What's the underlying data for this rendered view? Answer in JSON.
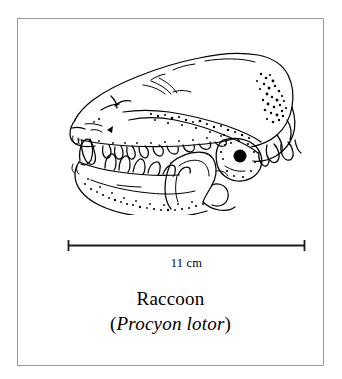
{
  "figure": {
    "type": "scientific-illustration-plate",
    "frame_color": "#9a9a9a",
    "background_color": "#ffffff",
    "ink_color": "#000000"
  },
  "illustration": {
    "name": "raccoon-skull-lateral-view",
    "orientation": "left-facing lateral",
    "parts": [
      "cranium",
      "braincase",
      "sagittal-crest",
      "occipital",
      "zygomatic-arch",
      "orbit",
      "auditory-bulla",
      "maxilla",
      "premaxilla",
      "upper-canine",
      "upper-premolars",
      "upper-molars",
      "mandible",
      "lower-canine",
      "lower-premolars",
      "lower-molars",
      "coronoid-process",
      "condylar-process",
      "angular-process"
    ]
  },
  "scale": {
    "label": "11 cm",
    "value": 11,
    "unit": "cm",
    "bar_style": "double-ended-tick",
    "bar_length_px": 239
  },
  "caption": {
    "common_name": "Raccoon",
    "open_paren": "(",
    "scientific_name": "Procyon lotor",
    "close_paren": ")",
    "genus": "Procyon",
    "species": "lotor"
  }
}
